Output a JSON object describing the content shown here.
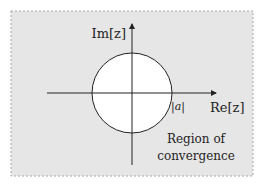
{
  "diagram": {
    "axes": {
      "imag_label": "Im[z]",
      "real_label": "Re[z]"
    },
    "circle": {
      "radius_label": "|a|"
    },
    "region_label_line1": "Region of",
    "region_label_line2": "convergence",
    "colors": {
      "region_fill": "#e6e6e6",
      "circle_fill": "#ffffff",
      "stroke": "#222222",
      "border": "#aaaaaa"
    }
  }
}
